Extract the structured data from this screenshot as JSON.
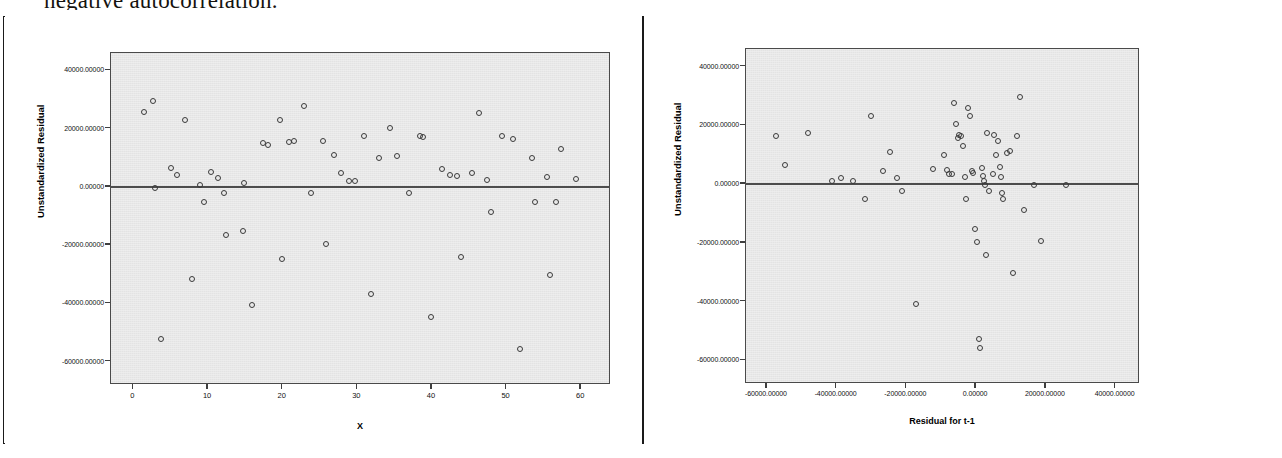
{
  "page": {
    "cut_off_heading": "negative autocorrelation."
  },
  "chart_data": [
    {
      "id": "left",
      "type": "scatter",
      "title": "",
      "xlabel": "X",
      "ylabel": "Unstandardized Residual",
      "xlim": [
        -3,
        64
      ],
      "ylim": [
        -68000,
        46000
      ],
      "xticks": [
        0,
        10,
        20,
        30,
        40,
        50,
        60
      ],
      "xticklabels": [
        "0",
        "10",
        "20",
        "30",
        "40",
        "50",
        "60"
      ],
      "yticks": [
        40000,
        20000,
        0,
        -20000,
        -40000,
        -60000
      ],
      "yticklabels": [
        "40000.00000",
        "20000.00000",
        "0.00000",
        "-20000.00000",
        "-40000.00000",
        "-60000.00000"
      ],
      "grid": false,
      "legend": "none",
      "zero_reference_line": 0,
      "marker": "open-circle",
      "points": [
        [
          1.5,
          25500
        ],
        [
          2.8,
          29200
        ],
        [
          3.0,
          -600
        ],
        [
          3.8,
          -52500
        ],
        [
          5.2,
          6200
        ],
        [
          6.0,
          3900
        ],
        [
          7.0,
          22800
        ],
        [
          8.0,
          -31800
        ],
        [
          9.0,
          200
        ],
        [
          9.6,
          -5500
        ],
        [
          10.5,
          4800
        ],
        [
          11.5,
          2700
        ],
        [
          12.3,
          -2400
        ],
        [
          12.5,
          -17000
        ],
        [
          14.8,
          -15500
        ],
        [
          15.0,
          900
        ],
        [
          16.0,
          -41000
        ],
        [
          17.5,
          14700
        ],
        [
          18.2,
          14000
        ],
        [
          19.8,
          22700
        ],
        [
          20.0,
          -25000
        ],
        [
          21.0,
          15200
        ],
        [
          21.6,
          15400
        ],
        [
          23.0,
          27300
        ],
        [
          24.0,
          -2500
        ],
        [
          25.5,
          15500
        ],
        [
          26.0,
          -20000
        ],
        [
          27.0,
          10600
        ],
        [
          28.0,
          4500
        ],
        [
          29.0,
          1800
        ],
        [
          29.8,
          1700
        ],
        [
          31.0,
          17000
        ],
        [
          32.0,
          -37000
        ],
        [
          33.0,
          9500
        ],
        [
          34.5,
          19800
        ],
        [
          35.5,
          10200
        ],
        [
          37.0,
          -2500
        ],
        [
          38.5,
          17200
        ],
        [
          39.0,
          16900
        ],
        [
          40.0,
          -45000
        ],
        [
          41.5,
          5800
        ],
        [
          42.5,
          3800
        ],
        [
          43.5,
          3500
        ],
        [
          44.0,
          -24500
        ],
        [
          45.5,
          4600
        ],
        [
          46.5,
          25000
        ],
        [
          47.5,
          2000
        ],
        [
          48.0,
          -9000
        ],
        [
          49.5,
          17000
        ],
        [
          51.0,
          16000
        ],
        [
          52.0,
          -56000
        ],
        [
          53.5,
          9500
        ],
        [
          54.0,
          -5500
        ],
        [
          55.5,
          3000
        ],
        [
          56.0,
          -30500
        ],
        [
          56.8,
          -5500
        ],
        [
          57.5,
          12600
        ],
        [
          59.5,
          2500
        ]
      ]
    },
    {
      "id": "right",
      "type": "scatter",
      "title": "",
      "xlabel": "Residual for t-1",
      "ylabel": "Unstandardized Residual",
      "xlim": [
        -66000,
        47000
      ],
      "ylim": [
        -68000,
        46000
      ],
      "xticks": [
        -60000,
        -40000,
        -20000,
        0,
        20000,
        40000
      ],
      "xticklabels": [
        "-60000.00000",
        "-40000.00000",
        "-20000.00000",
        "0.00000",
        "20000.00000",
        "40000.00000"
      ],
      "yticks": [
        40000,
        20000,
        0,
        -20000,
        -40000,
        -60000
      ],
      "yticklabels": [
        "40000.00000",
        "20000.00000",
        "0.00000",
        "-20000.00000",
        "-40000.00000",
        "-60000.00000"
      ],
      "grid": false,
      "legend": "none",
      "zero_reference_line": 0,
      "marker": "open-circle",
      "points": [
        [
          -57000,
          16000
        ],
        [
          -54500,
          6200
        ],
        [
          -48000,
          17200
        ],
        [
          -41000,
          900
        ],
        [
          -38500,
          1700
        ],
        [
          -35000,
          700
        ],
        [
          -31500,
          -5500
        ],
        [
          -30000,
          22800
        ],
        [
          -26500,
          4000
        ],
        [
          -24500,
          10600
        ],
        [
          -22500,
          1800
        ],
        [
          -21000,
          -2500
        ],
        [
          -17000,
          -41000
        ],
        [
          -12000,
          4800
        ],
        [
          -9000,
          9500
        ],
        [
          -8000,
          4500
        ],
        [
          -7500,
          3200
        ],
        [
          -6500,
          3000
        ],
        [
          -6000,
          27300
        ],
        [
          -5500,
          20000
        ],
        [
          -5000,
          15500
        ],
        [
          -4500,
          16500
        ],
        [
          -4000,
          16000
        ],
        [
          -3500,
          12600
        ],
        [
          -3000,
          2000
        ],
        [
          -2500,
          -5500
        ],
        [
          -2000,
          25500
        ],
        [
          -1500,
          22800
        ],
        [
          -1000,
          4000
        ],
        [
          -500,
          3500
        ],
        [
          0,
          -15500
        ],
        [
          500,
          -20000
        ],
        [
          1000,
          -53000
        ],
        [
          1500,
          -56000
        ],
        [
          2000,
          5000
        ],
        [
          2200,
          2600
        ],
        [
          2500,
          600
        ],
        [
          2800,
          -700
        ],
        [
          3000,
          -24500
        ],
        [
          3500,
          17000
        ],
        [
          4000,
          -2500
        ],
        [
          5000,
          3000
        ],
        [
          5500,
          16500
        ],
        [
          6000,
          9500
        ],
        [
          6500,
          14500
        ],
        [
          7000,
          5500
        ],
        [
          7500,
          2000
        ],
        [
          7800,
          -3500
        ],
        [
          8000,
          -5500
        ],
        [
          9000,
          10200
        ],
        [
          10000,
          11000
        ],
        [
          11000,
          -30500
        ],
        [
          12000,
          16000
        ],
        [
          13000,
          29200
        ],
        [
          14000,
          -9000
        ],
        [
          17000,
          -600
        ],
        [
          19000,
          -19800
        ],
        [
          26000,
          -600
        ]
      ]
    }
  ]
}
